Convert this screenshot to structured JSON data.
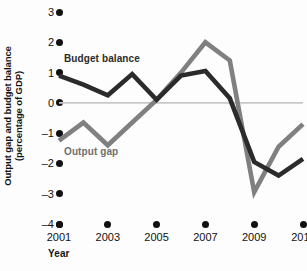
{
  "chart_data": {
    "type": "line",
    "title": "",
    "xlabel": "Year",
    "ylabel": "Output gap and budget balance (percentage of GDP)",
    "ylabel_line1": "Output gap and budget balance",
    "ylabel_line2": "(percentage of GDP)",
    "x": [
      2001,
      2002,
      2003,
      2004,
      2005,
      2006,
      2007,
      2008,
      2009,
      2010,
      2011
    ],
    "xlim": [
      2001,
      2011
    ],
    "ylim": [
      -4,
      3
    ],
    "yticks": [
      3,
      2,
      1,
      0,
      -1,
      -2,
      -3,
      -4
    ],
    "ytick_labels": [
      "3",
      "2",
      "1",
      "0",
      "–1",
      "–2",
      "–3",
      "–4"
    ],
    "xticks": [
      2001,
      2003,
      2005,
      2007,
      2009,
      2011
    ],
    "xtick_labels": [
      "2001",
      "2003",
      "2005",
      "2007",
      "2009",
      "2011"
    ],
    "grid": false,
    "zero_line": true,
    "legend_position": "inline",
    "series": [
      {
        "name": "Budget balance",
        "color": "#2b2b2b",
        "values": [
          0.9,
          0.6,
          0.25,
          0.95,
          0.1,
          0.9,
          1.05,
          0.15,
          -1.95,
          -2.4,
          -1.85
        ]
      },
      {
        "name": "Output gap",
        "color": "#808080",
        "values": [
          -1.25,
          -0.65,
          -1.4,
          -0.65,
          0.1,
          1.0,
          2.0,
          1.4,
          -2.95,
          -1.45,
          -0.7
        ]
      }
    ]
  },
  "axes": {
    "y_title_line1": "Output gap and budget balance",
    "y_title_line2": "(percentage of GDP)",
    "x_title": "Year"
  },
  "labels": {
    "budget_balance": "Budget balance",
    "output_gap": "Output gap"
  },
  "colors": {
    "budget_balance": "#2b2b2b",
    "output_gap": "#808080",
    "zero_line": "#c8c8c8",
    "tick": "#111111",
    "background": "#fdfdfd"
  }
}
